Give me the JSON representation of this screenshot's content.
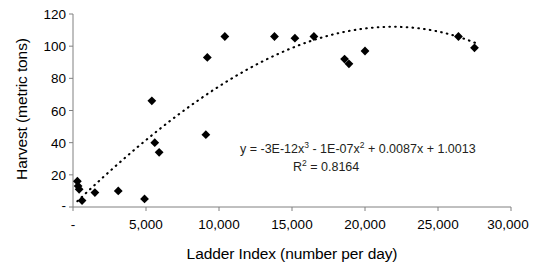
{
  "chart_data": {
    "type": "scatter",
    "title": "",
    "xlabel": "Ladder Index (number per day)",
    "ylabel": "Harvest (metric tons)",
    "xlim": [
      0,
      30000
    ],
    "ylim": [
      0,
      120
    ],
    "grid": false,
    "legend": null,
    "xticks": [
      "-",
      "5,000",
      "10,000",
      "15,000",
      "20,000",
      "25,000",
      "30,000"
    ],
    "xtick_values": [
      0,
      5000,
      10000,
      15000,
      20000,
      25000,
      30000
    ],
    "yticks": [
      "-",
      "20",
      "40",
      "60",
      "80",
      "100",
      "120"
    ],
    "ytick_values": [
      0,
      20,
      40,
      60,
      80,
      100,
      120
    ],
    "marker": "diamond",
    "marker_color": "#000000",
    "points": [
      {
        "x": 300,
        "y": 16
      },
      {
        "x": 350,
        "y": 13
      },
      {
        "x": 420,
        "y": 11
      },
      {
        "x": 620,
        "y": 4
      },
      {
        "x": 1500,
        "y": 9
      },
      {
        "x": 3100,
        "y": 10
      },
      {
        "x": 4900,
        "y": 5
      },
      {
        "x": 5400,
        "y": 66
      },
      {
        "x": 5600,
        "y": 40
      },
      {
        "x": 5900,
        "y": 34
      },
      {
        "x": 9100,
        "y": 45
      },
      {
        "x": 9200,
        "y": 93
      },
      {
        "x": 10400,
        "y": 106
      },
      {
        "x": 13800,
        "y": 106
      },
      {
        "x": 15200,
        "y": 105
      },
      {
        "x": 16500,
        "y": 106
      },
      {
        "x": 18600,
        "y": 92
      },
      {
        "x": 18900,
        "y": 89
      },
      {
        "x": 20000,
        "y": 97
      },
      {
        "x": 26400,
        "y": 106
      },
      {
        "x": 27500,
        "y": 99
      }
    ],
    "trendline": {
      "style": "dotted",
      "color": "#000000",
      "type": "polynomial",
      "order": 3,
      "coefficients": {
        "x3": -3e-12,
        "x2": -1e-07,
        "x1": 0.0087,
        "c": 1.0013
      },
      "equation_parts": {
        "lead": "y = -3E-12x",
        "exp3": "3",
        "mid1": " - 1E-07x",
        "exp2": "2",
        "mid2": " + 0.0087x + 1.0013",
        "r_lead": "R",
        "r_exp": "2",
        "r_tail": " = 0.8164"
      },
      "equation_text": "y = -3E-12x3 - 1E-07x2 + 0.0087x + 1.0013",
      "r_squared_text": "R2 = 0.8164",
      "r_squared": 0.8164
    }
  }
}
